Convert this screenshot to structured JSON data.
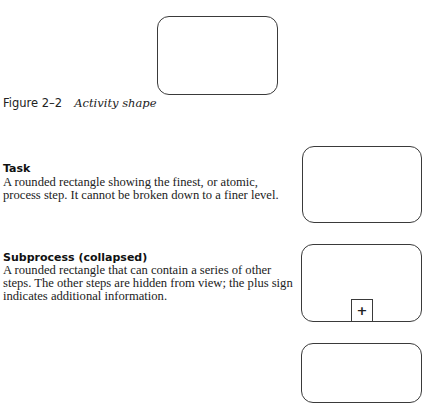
{
  "figure": {
    "number": "Figure 2–2",
    "title": "Activity shape"
  },
  "sections": [
    {
      "heading": "Task",
      "description": "A rounded rectangle showing the finest, or atomic, process step. It cannot be broken down to a finer level."
    },
    {
      "heading": "Subprocess (collapsed)",
      "description": "A rounded rectangle that can contain a series of other steps. The other steps are hidden from view; the plus sign indicates additional information.",
      "marker": "+"
    }
  ]
}
